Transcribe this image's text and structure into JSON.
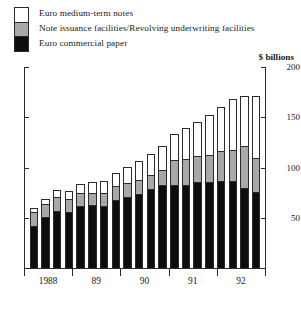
{
  "legend": {
    "items": [
      {
        "label": "Euro medium-term notes",
        "swatch": "white",
        "color": "#ffffff"
      },
      {
        "label": "Note issuance facilities/Revolving underwriting facilities",
        "swatch": "gray",
        "color": "#a8a8a8"
      },
      {
        "label": "Euro commercial paper",
        "swatch": "black",
        "color": "#0d0d0d"
      }
    ]
  },
  "units_label": "$ billions",
  "chart_data": {
    "type": "bar",
    "title": "",
    "subtitle": "",
    "xlabel": "",
    "ylabel": "$ billions",
    "ylim": [
      0,
      200
    ],
    "yticks": [
      0,
      50,
      100,
      150,
      200
    ],
    "ytick_labels": [
      "",
      "50",
      "100",
      "150",
      "200"
    ],
    "grid": false,
    "stacked": true,
    "legend_position": "top-left",
    "categories": [
      "1988 Q1",
      "1988 Q2",
      "1988 Q3",
      "1988 Q4",
      "89 Q1",
      "89 Q2",
      "89 Q3",
      "89 Q4",
      "90 Q1",
      "90 Q2",
      "90 Q3",
      "90 Q4",
      "91 Q1",
      "91 Q2",
      "91 Q3",
      "91 Q4",
      "92 Q1",
      "92 Q2",
      "92 Q3",
      "92 Q4"
    ],
    "year_groups": [
      "1988",
      "89",
      "90",
      "91",
      "92"
    ],
    "series": [
      {
        "name": "Euro commercial paper",
        "color": "#0d0d0d",
        "values": [
          43,
          51,
          57,
          56,
          62,
          63,
          62,
          68,
          71,
          74,
          79,
          83,
          83,
          83,
          86,
          86,
          87,
          87,
          80,
          76
        ]
      },
      {
        "name": "Note issuance facilities/Revolving underwriting facilities",
        "color": "#a8a8a8",
        "values": [
          14,
          14,
          15,
          14,
          14,
          13,
          13,
          14,
          14,
          14,
          14,
          15,
          25,
          26,
          26,
          27,
          30,
          31,
          42,
          34
        ]
      },
      {
        "name": "Euro medium-term notes",
        "color": "#ffffff",
        "values": [
          3,
          4,
          6,
          7,
          8,
          10,
          12,
          13,
          16,
          18,
          20,
          23,
          25,
          30,
          33,
          39,
          43,
          50,
          49,
          61
        ]
      }
    ],
    "totals": [
      60,
      69,
      78,
      77,
      84,
      86,
      87,
      95,
      101,
      106,
      113,
      121,
      133,
      139,
      145,
      152,
      160,
      168,
      171,
      171
    ]
  }
}
